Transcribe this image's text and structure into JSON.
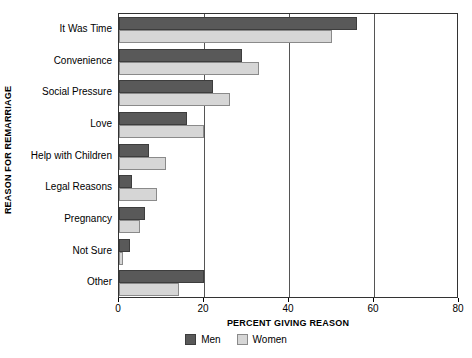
{
  "chart_data": {
    "type": "bar",
    "orientation": "horizontal",
    "title": "",
    "xlabel": "PERCENT GIVING REASON",
    "ylabel": "REASON FOR REMARRIAGE",
    "xlim": [
      0,
      80
    ],
    "xticks": [
      0,
      20,
      40,
      60,
      80
    ],
    "xticklabels": [
      "0",
      "20",
      "40",
      "60",
      "80"
    ],
    "grid": "vertical-at-xticks",
    "legend_position": "bottom-center",
    "categories": [
      "It Was Time",
      "Convenience",
      "Social Pressure",
      "Love",
      "Help with Children",
      "Legal Reasons",
      "Pregnancy",
      "Not Sure",
      "Other"
    ],
    "series": [
      {
        "name": "Men",
        "color": "#595959",
        "values": [
          56,
          29,
          22,
          16,
          7,
          3,
          6,
          2.5,
          20
        ]
      },
      {
        "name": "Women",
        "color": "#d6d6d6",
        "values": [
          50,
          33,
          26,
          20,
          11,
          9,
          5,
          1,
          14
        ]
      }
    ]
  },
  "legend": {
    "items": [
      {
        "label": "Men",
        "swatch": "men"
      },
      {
        "label": "Women",
        "swatch": "women"
      }
    ]
  },
  "colors": {
    "men": "#595959",
    "women": "#d6d6d6",
    "frame": "#333333",
    "gridline": "#555555",
    "background": "#ffffff"
  }
}
